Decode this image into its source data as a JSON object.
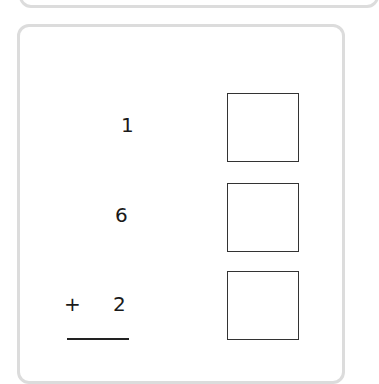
{
  "problem": {
    "addends": [
      "1",
      "6",
      "2"
    ],
    "operator": "+",
    "answer_boxes": [
      "",
      "",
      ""
    ]
  }
}
